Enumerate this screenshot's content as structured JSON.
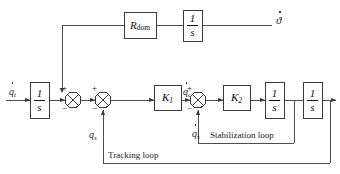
{
  "diagram": {
    "type": "control-block-diagram",
    "colors": {
      "line": "#4d4d4d",
      "block_border": "#3a3a3a",
      "text": "#1a1a1a",
      "background": "#ffffff"
    },
    "blocks": [
      {
        "id": "int_input",
        "label": "1/s",
        "numerator": "1",
        "denominator": "s",
        "x": 30,
        "y": 82,
        "w": 19,
        "h": 36
      },
      {
        "id": "r_dom",
        "label": "R_dom",
        "base": "R",
        "sub": "dom",
        "x": 124,
        "y": 12,
        "w": 32,
        "h": 26
      },
      {
        "id": "int_top",
        "label": "1/s",
        "numerator": "1",
        "denominator": "s",
        "x": 183,
        "y": 10,
        "w": 19,
        "h": 31
      },
      {
        "id": "gain_k1",
        "label": "K1",
        "base": "K",
        "sub": "1",
        "x": 154,
        "y": 85,
        "w": 27,
        "h": 25
      },
      {
        "id": "gain_k2",
        "label": "K2",
        "base": "K",
        "sub": "2",
        "x": 223,
        "y": 85,
        "w": 27,
        "h": 25
      },
      {
        "id": "int_rate",
        "label": "1/s",
        "numerator": "1",
        "denominator": "s",
        "x": 265,
        "y": 82,
        "w": 19,
        "h": 36
      },
      {
        "id": "int_pos",
        "label": "1/s",
        "numerator": "1",
        "denominator": "s",
        "x": 303,
        "y": 82,
        "w": 19,
        "h": 36
      }
    ],
    "summing_junctions": [
      {
        "id": "sum1",
        "cx": 73,
        "cy": 100,
        "r": 8,
        "signs": [
          {
            "s": "+",
            "pos": "left-top"
          },
          {
            "s": "−",
            "pos": "left-bottom"
          }
        ]
      },
      {
        "id": "sum2",
        "cx": 103,
        "cy": 100,
        "r": 8,
        "signs": [
          {
            "s": "+",
            "pos": "left-top"
          },
          {
            "s": "−",
            "pos": "left-bottom"
          }
        ]
      },
      {
        "id": "sum3",
        "cx": 198,
        "cy": 100,
        "r": 8,
        "signs": [
          {
            "s": "+",
            "pos": "left-top"
          },
          {
            "s": "−",
            "pos": "left-bottom"
          }
        ]
      }
    ],
    "signal_labels": {
      "input_qt": "q",
      "input_qt_sub": "t",
      "qs": "q",
      "qs_sub": "s",
      "qc_dot": "q",
      "qc_dot_sub": "c",
      "qs_dot": "q",
      "qs_dot_sub": "s",
      "output_theta": "ϑ"
    },
    "loop_labels": {
      "tracking": "Tracking loop",
      "stabilization": "Stabilization loop"
    },
    "signs": {
      "plus": "+",
      "minus": "−"
    }
  }
}
